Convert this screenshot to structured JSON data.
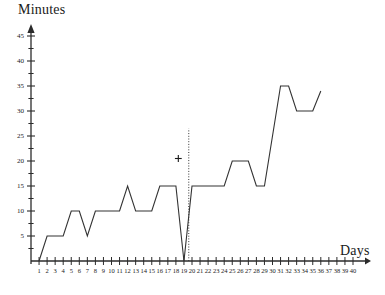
{
  "chart_data": {
    "type": "line",
    "title": "",
    "xlabel": "Days",
    "ylabel": "Minutes",
    "xlim": [
      0,
      40
    ],
    "ylim": [
      0,
      45
    ],
    "grid": false,
    "legend": null,
    "x_tick_labels": [
      "1",
      "2",
      "3",
      "4",
      "5",
      "6",
      "7",
      "8",
      "9",
      "10",
      "11",
      "12",
      "13",
      "14",
      "15",
      "16",
      "17",
      "18",
      "19",
      "20",
      "21",
      "22",
      "23",
      "24",
      "25",
      "26",
      "27",
      "28",
      "29",
      "30",
      "31",
      "32",
      "33",
      "34",
      "35",
      "36",
      "37",
      "38",
      "39",
      "40"
    ],
    "y_tick_labels": [
      "5",
      "10",
      "15",
      "20",
      "25",
      "30",
      "35",
      "40",
      "45"
    ],
    "y_major_ticks": [
      5,
      10,
      15,
      20,
      25,
      30,
      35,
      40,
      45
    ],
    "y_minor_ticks": [
      2.5,
      7.5,
      12.5,
      17.5,
      22.5,
      27.5,
      32.5,
      37.5,
      42.5
    ],
    "x": [
      1,
      2,
      3,
      4,
      5,
      6,
      7,
      8,
      9,
      10,
      11,
      12,
      13,
      14,
      15,
      16,
      17,
      18,
      19,
      20,
      21,
      22,
      23,
      24,
      25,
      26,
      27,
      28,
      29,
      30,
      31,
      32,
      33,
      34,
      35,
      36
    ],
    "values": [
      0,
      5,
      5,
      5,
      10,
      10,
      5,
      10,
      10,
      10,
      10,
      15,
      10,
      10,
      10,
      15,
      15,
      15,
      0,
      15,
      15,
      15,
      15,
      15,
      20,
      20,
      20,
      15,
      15,
      25,
      35,
      35,
      30,
      30,
      30,
      34
    ],
    "series": [
      {
        "name": "Minutes per day",
        "color": "#333333",
        "values": [
          0,
          5,
          5,
          5,
          10,
          10,
          5,
          10,
          10,
          10,
          10,
          15,
          10,
          10,
          10,
          15,
          15,
          15,
          0,
          15,
          15,
          15,
          15,
          15,
          20,
          20,
          20,
          15,
          15,
          25,
          35,
          35,
          30,
          30,
          30,
          34
        ]
      }
    ],
    "annotations": [
      {
        "type": "marker",
        "symbol": "+",
        "name": "plus-marker",
        "x": 18.3,
        "y": 20.5
      },
      {
        "type": "vertical-dotted-line",
        "name": "phase-divider",
        "x": 19.6,
        "y_from": 0,
        "y_to": 26.5
      }
    ],
    "axis_color": "#2b2b2b",
    "line_color": "#333333"
  }
}
